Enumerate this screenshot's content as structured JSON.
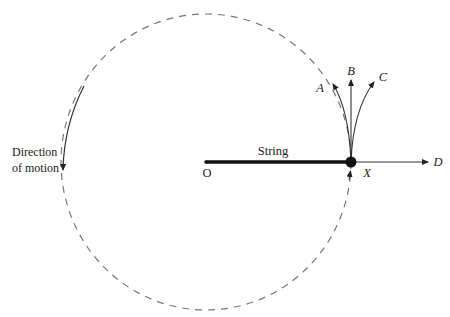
{
  "diagram": {
    "center_label": "O",
    "string_label": "String",
    "ball_label": "X",
    "direction_label_line1": "Direction",
    "direction_label_line2": "of motion",
    "path_labels": {
      "A": "A",
      "B": "B",
      "C": "C",
      "D": "D"
    },
    "colors": {
      "string": "#111111",
      "dashed_circle": "#777777",
      "paths": "#333333",
      "text": "#222222"
    }
  }
}
